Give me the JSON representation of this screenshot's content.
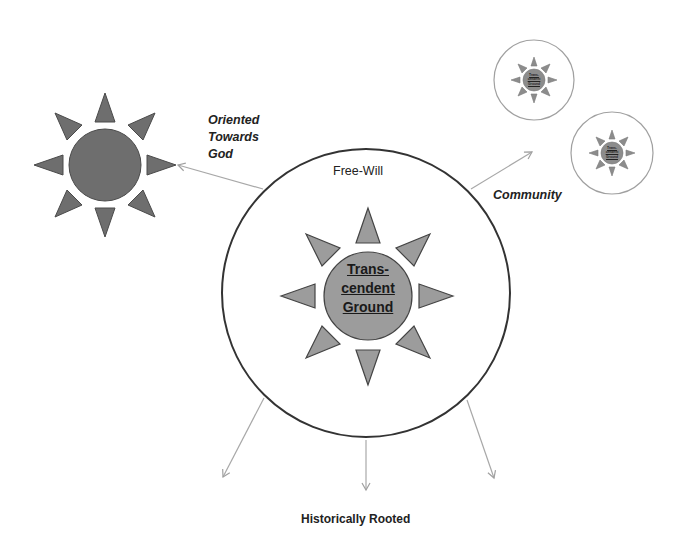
{
  "diagram": {
    "type": "concept-diagram",
    "colors": {
      "background": "#ffffff",
      "circle_stroke": "#3a3a3a",
      "small_circle_stroke": "#9a9a9a",
      "arrow_stroke": "#a8a8a8",
      "left_sun_fill": "#707070",
      "center_sun_fill": "#9a9a9a",
      "mini_sun_fill": "#8a8a8a",
      "text": "#222222"
    },
    "labels": {
      "oriented": [
        "Oriented",
        "Towards",
        "God"
      ],
      "free_will": "Free-Will",
      "community": "Community",
      "historically_rooted": "Historically Rooted",
      "center_sun": [
        "Trans-",
        "cendent",
        "Ground"
      ],
      "mini_sun": [
        "Trans-",
        "cendent",
        "Ground"
      ]
    },
    "nodes": [
      {
        "id": "god-sun",
        "label": "",
        "shape": "sun",
        "center": [
          105,
          165
        ],
        "radius": 37
      },
      {
        "id": "self-circle",
        "label": "Free-Will",
        "shape": "circle",
        "center": [
          366,
          292
        ],
        "radius": 144
      },
      {
        "id": "center-sun",
        "label": "Trans-cendent Ground",
        "shape": "sun",
        "center": [
          368,
          296
        ],
        "radius": 44
      },
      {
        "id": "community-member-1",
        "shape": "circle-with-sun",
        "center": [
          534,
          80
        ],
        "radius": 40
      },
      {
        "id": "community-member-2",
        "shape": "circle-with-sun",
        "center": [
          612,
          153
        ],
        "radius": 41
      }
    ],
    "edges": [
      {
        "from": "self-circle",
        "to": "god-sun",
        "label": "Oriented Towards God"
      },
      {
        "from": "self-circle",
        "to": "community-members",
        "label": "Community"
      },
      {
        "from": "self-circle",
        "to": "below-left",
        "label": "Historically Rooted"
      },
      {
        "from": "self-circle",
        "to": "below",
        "label": "Historically Rooted"
      },
      {
        "from": "self-circle",
        "to": "below-right",
        "label": "Historically Rooted"
      }
    ]
  }
}
